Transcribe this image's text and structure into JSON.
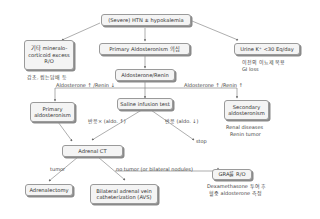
{
  "nodes": {
    "root": "(Severe) HTN ± hypokalemia",
    "other_mc": "기타 mineralo-corticoid excess R/O",
    "primary_suspect": "Primary Aldosteronism 의심",
    "urine_k": "Urine K⁺ <30 Eq/day",
    "ratio": "Aldosterone/Renin",
    "primary": "Primary aldosteronism",
    "saline": "Saline infusion test",
    "secondary": "Secondary aldosteronism",
    "adrenal_ct": "Adrenal CT",
    "adrenalectomy": "Adrenalectomy",
    "avs": "Bilateral adrenal vein catheterization (AVS)",
    "gra": "GRA를 R/O"
  },
  "notes": {
    "other_mc_note": "감초, 씹는담배 등",
    "urine_k_note_1": "이전의 이뇨제 복용",
    "urine_k_note_2": "GI loss",
    "secondary_note_1": "Renal diseases",
    "secondary_note_2": "Renin tumor",
    "gra_note_1": "Dexamethasone 투여 후",
    "gra_note_2": "혈중 aldosterone 측정"
  },
  "edge_labels": {
    "aldo_up_renin_down": "Aldosterone ↑ /Renin ↓",
    "aldo_up_renin_up": "Aldosterone ↑ /Renin ↑",
    "no_response": "반응× (aldo. ↑)",
    "response": "반응 (aldo. ↓)",
    "stop": "stop",
    "tumor": "tumor",
    "no_tumor": "no tumor (or bilateral nodules)"
  }
}
